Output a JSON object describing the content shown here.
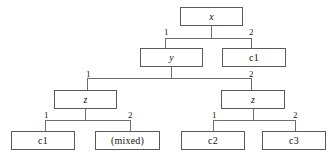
{
  "diagram": {
    "nodes": [
      {
        "id": "root",
        "label": "x",
        "style": "var",
        "x": 180,
        "y": 7,
        "w": 63,
        "h": 19
      },
      {
        "id": "l2a",
        "label": "y",
        "style": "var",
        "x": 140,
        "y": 48,
        "w": 63,
        "h": 19
      },
      {
        "id": "l2b",
        "label": "c1",
        "style": "const",
        "x": 222,
        "y": 48,
        "w": 64,
        "h": 19
      },
      {
        "id": "l3a",
        "label": "z",
        "style": "var",
        "x": 54,
        "y": 90,
        "w": 63,
        "h": 19
      },
      {
        "id": "l3b",
        "label": "z",
        "style": "var",
        "x": 221,
        "y": 90,
        "w": 64,
        "h": 19
      },
      {
        "id": "l4a",
        "label": "c1",
        "style": "const",
        "x": 11,
        "y": 131,
        "w": 64,
        "h": 19
      },
      {
        "id": "l4b",
        "label": "(mixed)",
        "style": "const",
        "x": 95,
        "y": 131,
        "w": 65,
        "h": 19
      },
      {
        "id": "l4c",
        "label": "c2",
        "style": "const",
        "x": 181,
        "y": 131,
        "w": 64,
        "h": 19
      },
      {
        "id": "l4d",
        "label": "c3",
        "style": "const",
        "x": 262,
        "y": 131,
        "w": 64,
        "h": 19
      }
    ],
    "edge_labels": [
      {
        "id": "e1-1",
        "text": "1",
        "x": 164,
        "y": 28
      },
      {
        "id": "e1-2",
        "text": "2",
        "x": 249,
        "y": 28
      },
      {
        "id": "e2-1",
        "text": "1",
        "x": 86,
        "y": 70
      },
      {
        "id": "e2-2",
        "text": "2",
        "x": 249,
        "y": 70
      },
      {
        "id": "e3-1",
        "text": "1",
        "x": 44,
        "y": 111
      },
      {
        "id": "e3-2",
        "text": "2",
        "x": 128,
        "y": 111
      },
      {
        "id": "e4-1",
        "text": "1",
        "x": 212,
        "y": 111
      },
      {
        "id": "e4-2",
        "text": "2",
        "x": 293,
        "y": 111
      }
    ],
    "edges": [
      {
        "id": "stem-root",
        "type": "v",
        "x": 211,
        "y": 26,
        "len": 12
      },
      {
        "id": "bar-root",
        "type": "h",
        "x": 165,
        "y": 38,
        "len": 86
      },
      {
        "id": "drop-1-1",
        "type": "v",
        "x": 165,
        "y": 38,
        "len": 10
      },
      {
        "id": "drop-1-2",
        "type": "v",
        "x": 251,
        "y": 38,
        "len": 10
      },
      {
        "id": "stem-y",
        "type": "v",
        "x": 171,
        "y": 67,
        "len": 11
      },
      {
        "id": "bar-y",
        "type": "h",
        "x": 87,
        "y": 78,
        "len": 165
      },
      {
        "id": "drop-2-1",
        "type": "v",
        "x": 87,
        "y": 78,
        "len": 12
      },
      {
        "id": "drop-2-2",
        "type": "v",
        "x": 251,
        "y": 78,
        "len": 12
      },
      {
        "id": "stem-z1",
        "type": "v",
        "x": 85,
        "y": 109,
        "len": 11
      },
      {
        "id": "bar-z1",
        "type": "h",
        "x": 45,
        "y": 120,
        "len": 85
      },
      {
        "id": "drop-3-1",
        "type": "v",
        "x": 45,
        "y": 120,
        "len": 11
      },
      {
        "id": "drop-3-2",
        "type": "v",
        "x": 130,
        "y": 120,
        "len": 11
      },
      {
        "id": "stem-z2",
        "type": "v",
        "x": 253,
        "y": 109,
        "len": 11
      },
      {
        "id": "bar-z2",
        "type": "h",
        "x": 213,
        "y": 120,
        "len": 82
      },
      {
        "id": "drop-4-1",
        "type": "v",
        "x": 213,
        "y": 120,
        "len": 11
      },
      {
        "id": "drop-4-2",
        "type": "v",
        "x": 295,
        "y": 120,
        "len": 11
      }
    ]
  },
  "colors": {
    "box_border": "#5a5a5a",
    "edge_line": "#6e6e6e",
    "text": "#111111",
    "background": "#ffffff"
  }
}
